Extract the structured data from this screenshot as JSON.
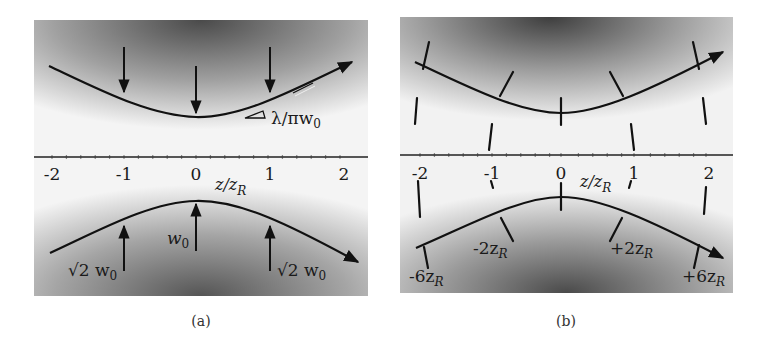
{
  "figure": {
    "axis": {
      "label": "z/z_R",
      "label_main": "z/z",
      "label_sub": "R",
      "ticks": [
        "-2",
        "-1",
        "0",
        "1",
        "2"
      ],
      "tick_values": [
        -2,
        -1,
        0,
        1,
        2
      ],
      "minor_ticks_per_unit": 5
    },
    "panels": [
      {
        "id": "a",
        "caption": "(a)",
        "description": "Beam waist envelope with width arrows",
        "annotations": {
          "divergence": "λ/πw",
          "divergence_sub": "0",
          "waist": "w",
          "waist_sub": "0",
          "sqrt2_left": "√2 w",
          "sqrt2_left_sub": "0",
          "sqrt2_right": "√2 w",
          "sqrt2_right_sub": "0"
        },
        "arrows_at": [
          -1,
          0,
          1
        ]
      },
      {
        "id": "b",
        "caption": "(b)",
        "description": "Wavefront curvature at various positions",
        "annotations": {
          "minus6": "-6z",
          "minus6_sub": "R",
          "minus2": "-2z",
          "minus2_sub": "R",
          "plus2": "+2z",
          "plus2_sub": "R",
          "plus6": "+6z",
          "plus6_sub": "R"
        },
        "wavefronts_at": [
          -2,
          -1,
          0,
          1,
          2
        ]
      }
    ],
    "colors": {
      "dark": "#4a4a4a",
      "light": "#f4f4f4",
      "ink": "#111111"
    }
  }
}
